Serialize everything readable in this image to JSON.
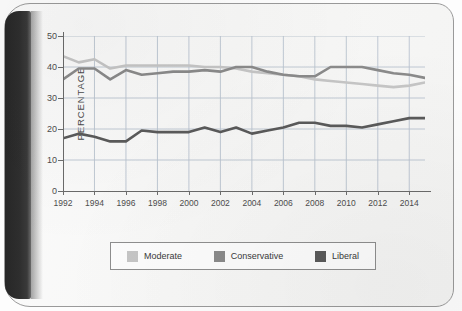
{
  "chart_data": {
    "type": "line",
    "title": "",
    "xlabel": "",
    "ylabel": "PERCENTAGE",
    "x": [
      1992,
      1993,
      1994,
      1995,
      1996,
      1997,
      1998,
      1999,
      2000,
      2001,
      2002,
      2003,
      2004,
      2005,
      2006,
      2007,
      2008,
      2009,
      2010,
      2011,
      2012,
      2013,
      2014,
      2015
    ],
    "xticks": [
      "1992",
      "1994",
      "1996",
      "1998",
      "2000",
      "2002",
      "2004",
      "2006",
      "2008",
      "2010",
      "2012",
      "2014"
    ],
    "xtick_values": [
      1992,
      1994,
      1996,
      1998,
      2000,
      2002,
      2004,
      2006,
      2008,
      2010,
      2012,
      2014
    ],
    "yticks": [
      "0",
      "10",
      "20",
      "30",
      "40",
      "50"
    ],
    "ytick_values": [
      0,
      10,
      20,
      30,
      40,
      50
    ],
    "xlim": [
      1992,
      2015
    ],
    "ylim": [
      0,
      50
    ],
    "grid": true,
    "legend_position": "bottom",
    "series": [
      {
        "name": "Moderate",
        "color": "#c5c5c5",
        "values": [
          43.5,
          41.5,
          42.5,
          39.5,
          40.5,
          40.5,
          40.5,
          40.5,
          40.5,
          40.0,
          40.0,
          39.5,
          38.5,
          38.0,
          37.5,
          37.0,
          36.0,
          35.5,
          35.0,
          34.5,
          34.0,
          33.5,
          34.0,
          35.0
        ]
      },
      {
        "name": "Conservative",
        "color": "#8a8a8a",
        "values": [
          36.0,
          39.5,
          39.5,
          36.0,
          39.0,
          37.5,
          38.0,
          38.5,
          38.5,
          39.0,
          38.5,
          40.0,
          40.0,
          38.5,
          37.5,
          37.0,
          37.0,
          40.0,
          40.0,
          40.0,
          39.0,
          38.0,
          37.5,
          36.5
        ]
      },
      {
        "name": "Liberal",
        "color": "#5a5a5a",
        "values": [
          17.0,
          18.5,
          17.5,
          16.0,
          16.0,
          19.5,
          19.0,
          19.0,
          19.0,
          20.5,
          19.0,
          20.5,
          18.5,
          19.5,
          20.5,
          22.0,
          22.0,
          21.0,
          21.0,
          20.5,
          21.5,
          22.5,
          23.5,
          23.5
        ]
      }
    ]
  },
  "legend": {
    "items": [
      {
        "label": "Moderate",
        "color": "#c5c5c5"
      },
      {
        "label": "Conservative",
        "color": "#8a8a8a"
      },
      {
        "label": "Liberal",
        "color": "#5a5a5a"
      }
    ]
  },
  "axis": {
    "y_title": "PERCENTAGE"
  },
  "style": {
    "grid_color": "#b9c3cf",
    "axis_color": "#6a6a6a",
    "text_color": "#4d4d4d"
  }
}
